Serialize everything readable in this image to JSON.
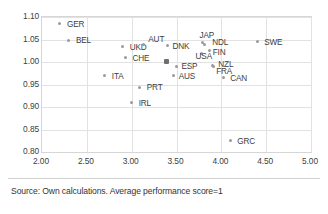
{
  "figure": {
    "source_note": "Source: Own calculations. Average performance score=1"
  },
  "chart_data": {
    "type": "scatter",
    "title": "",
    "xlabel": "",
    "ylabel": "",
    "xlim": [
      2.0,
      5.0
    ],
    "ylim": [
      0.8,
      1.1
    ],
    "xticks": [
      "2.00",
      "2.50",
      "3.00",
      "3.50",
      "4.00",
      "4.50",
      "5.00"
    ],
    "xtick_values": [
      2.0,
      2.5,
      3.0,
      3.5,
      4.0,
      4.5,
      5.0
    ],
    "yticks": [
      "0.80",
      "0.85",
      "0.90",
      "0.95",
      "1.00",
      "1.05",
      "1.10"
    ],
    "ytick_values": [
      0.8,
      0.85,
      0.9,
      0.95,
      1.0,
      1.05,
      1.1
    ],
    "grid": true,
    "legend": "none",
    "marker_color": "#9a9a9a",
    "highlight_color": "#6f6f6f",
    "points": [
      {
        "label": "GER",
        "x": 2.2,
        "y": 1.085,
        "label_dx": 7,
        "label_dy": -3
      },
      {
        "label": "BEL",
        "x": 2.3,
        "y": 1.048,
        "label_dx": 7,
        "label_dy": -3
      },
      {
        "label": "UKD",
        "x": 2.9,
        "y": 1.034,
        "label_dx": 7,
        "label_dy": -3
      },
      {
        "label": "CHE",
        "x": 2.93,
        "y": 1.009,
        "label_dx": 7,
        "label_dy": -3
      },
      {
        "label": "AUT",
        "x": 3.13,
        "y": 1.038,
        "label_dx": 5,
        "label_dy": -9
      },
      {
        "label": "ITA",
        "x": 2.7,
        "y": 0.969,
        "label_dx": 7,
        "label_dy": -3
      },
      {
        "label": "PRT",
        "x": 3.09,
        "y": 0.944,
        "label_dx": 7,
        "label_dy": -3
      },
      {
        "label": "IRL",
        "x": 3.0,
        "y": 0.91,
        "label_dx": 7,
        "label_dy": -3
      },
      {
        "label": "DNK",
        "x": 3.4,
        "y": 1.037,
        "label_dx": 5,
        "label_dy": -2
      },
      {
        "label": "ESP",
        "x": 3.5,
        "y": 0.991,
        "label_dx": 5,
        "label_dy": -3
      },
      {
        "label": "AUS",
        "x": 3.47,
        "y": 0.969,
        "label_dx": 5,
        "label_dy": -3
      },
      {
        "label": "JAP",
        "x": 3.79,
        "y": 1.043,
        "label_dx": -3,
        "label_dy": -11
      },
      {
        "label": "NDL",
        "x": 3.81,
        "y": 1.039,
        "label_dx": 8,
        "label_dy": -5
      },
      {
        "label": "USA",
        "x": 3.78,
        "y": 1.018,
        "label_dx": -6,
        "label_dy": -1
      },
      {
        "label": "FIN",
        "x": 3.87,
        "y": 1.026,
        "label_dx": 3,
        "label_dy": -1
      },
      {
        "label": "NZL",
        "x": 3.9,
        "y": 0.993,
        "label_dx": 6,
        "label_dy": -4
      },
      {
        "label": "FRA",
        "x": 3.91,
        "y": 0.991,
        "label_dx": 3,
        "label_dy": 2
      },
      {
        "label": "CAN",
        "x": 4.02,
        "y": 0.965,
        "label_dx": 7,
        "label_dy": 0
      },
      {
        "label": "SWE",
        "x": 4.4,
        "y": 1.045,
        "label_dx": 7,
        "label_dy": -3
      },
      {
        "label": "GRC",
        "x": 4.1,
        "y": 0.825,
        "label_dx": 7,
        "label_dy": -3
      }
    ],
    "reference_marker": {
      "label": "",
      "x": 3.39,
      "y": 1.001,
      "style": "square-dark"
    }
  }
}
